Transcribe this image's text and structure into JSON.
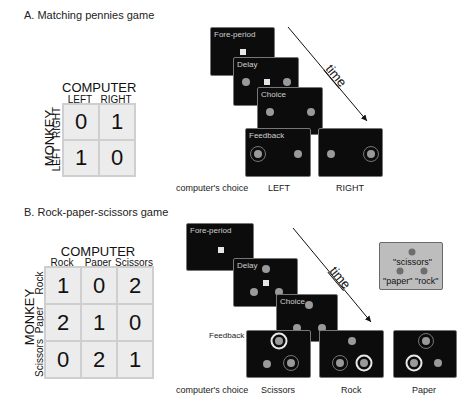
{
  "panel_a": {
    "title": "A. Matching pennies game",
    "matrix": {
      "col_header": "COMPUTER",
      "row_header": "MONKEY",
      "col_labels": [
        "LEFT",
        "RIGHT"
      ],
      "row_labels": [
        "RIGHT",
        "LEFT"
      ],
      "values": [
        [
          "0",
          "1"
        ],
        [
          "1",
          "0"
        ]
      ]
    },
    "screens": {
      "foreperiod": "Fore-period",
      "delay": "Delay",
      "choice": "Choice",
      "feedback": "Feedback"
    },
    "time_label": "time",
    "computers_choice_label": "computer's choice",
    "choice_labels": [
      "LEFT",
      "RIGHT"
    ]
  },
  "panel_b": {
    "title": "B. Rock-paper-scissors game",
    "matrix": {
      "col_header": "COMPUTER",
      "row_header": "MONKEY",
      "col_labels": [
        "Rock",
        "Paper",
        "Scissors"
      ],
      "row_labels": [
        "Rock",
        "Paper",
        "Scissors"
      ],
      "values": [
        [
          "1",
          "0",
          "2"
        ],
        [
          "2",
          "1",
          "0"
        ],
        [
          "0",
          "2",
          "1"
        ]
      ]
    },
    "screens": {
      "foreperiod": "Fore-period",
      "delay": "Delay",
      "choice": "Choice",
      "feedback": "Feedback"
    },
    "time_label": "time",
    "legend": {
      "top": "\"scissors\"",
      "left": "\"paper\"",
      "right": "\"rock\""
    },
    "computers_choice_label": "computer's choice",
    "choice_labels": [
      "Scissors",
      "Rock",
      "Paper"
    ]
  },
  "colors": {
    "screen_bg": "#0c0c0c",
    "target_dot": "#9a9a9a",
    "fixation_square": "#e6e6e6",
    "matrix_bg": "#ececec",
    "legend_bg": "#bdbdbd"
  }
}
